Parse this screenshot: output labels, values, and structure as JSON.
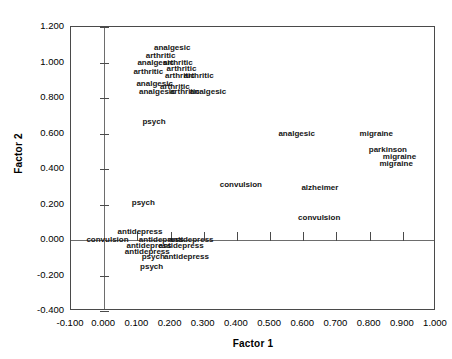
{
  "chart_data": {
    "type": "scatter",
    "title": "",
    "xlabel": "Factor 1",
    "ylabel": "Factor 2",
    "xlim": [
      -0.1,
      1.0
    ],
    "ylim": [
      -0.4,
      1.2
    ],
    "grid": false,
    "legend": "none",
    "xticks": [
      "-0.100",
      "0.000",
      "0.100",
      "0.200",
      "0.300",
      "0.400",
      "0.500",
      "0.600",
      "0.700",
      "0.800",
      "0.900",
      "1.000"
    ],
    "xtickvalues": [
      -0.1,
      0.0,
      0.1,
      0.2,
      0.3,
      0.4,
      0.5,
      0.6,
      0.7,
      0.8,
      0.9,
      1.0
    ],
    "yticks": [
      "1.200",
      "1.000",
      "0.800",
      "0.600",
      "0.400",
      "0.200",
      "0.000",
      "-0.200",
      "-0.400"
    ],
    "ytickvalues": [
      1.2,
      1.0,
      0.8,
      0.6,
      0.4,
      0.2,
      0.0,
      -0.2,
      -0.4
    ],
    "marker": "text-label",
    "points": [
      {
        "label": "analgesic",
        "x": 0.205,
        "y": 1.088
      },
      {
        "label": "arthritic",
        "x": 0.17,
        "y": 1.045
      },
      {
        "label": "analgesic",
        "x": 0.155,
        "y": 1.005
      },
      {
        "label": "arthritic",
        "x": 0.222,
        "y": 1.005
      },
      {
        "label": "arthritic",
        "x": 0.233,
        "y": 0.968
      },
      {
        "label": "arthritic",
        "x": 0.133,
        "y": 0.95
      },
      {
        "label": "arthritic",
        "x": 0.228,
        "y": 0.93
      },
      {
        "label": "arthritic",
        "x": 0.285,
        "y": 0.93
      },
      {
        "label": "analgesic",
        "x": 0.152,
        "y": 0.887
      },
      {
        "label": "arthritic",
        "x": 0.213,
        "y": 0.87
      },
      {
        "label": "analgesic",
        "x": 0.16,
        "y": 0.838
      },
      {
        "label": "arthritic",
        "x": 0.243,
        "y": 0.838
      },
      {
        "label": "analgesic",
        "x": 0.313,
        "y": 0.838
      },
      {
        "label": "psych",
        "x": 0.15,
        "y": 0.672
      },
      {
        "label": "analgesic",
        "x": 0.58,
        "y": 0.603
      },
      {
        "label": "migraine",
        "x": 0.82,
        "y": 0.603
      },
      {
        "label": "parkinson",
        "x": 0.855,
        "y": 0.512
      },
      {
        "label": "migraine",
        "x": 0.89,
        "y": 0.475
      },
      {
        "label": "migraine",
        "x": 0.88,
        "y": 0.435
      },
      {
        "label": "convulsion",
        "x": 0.412,
        "y": 0.318
      },
      {
        "label": "alzheimer",
        "x": 0.65,
        "y": 0.3
      },
      {
        "label": "psych",
        "x": 0.118,
        "y": 0.212
      },
      {
        "label": "convulsion",
        "x": 0.648,
        "y": 0.128
      },
      {
        "label": "antidepress",
        "x": 0.108,
        "y": 0.05
      },
      {
        "label": "convulsion",
        "x": 0.01,
        "y": 0.003
      },
      {
        "label": "antidepress",
        "x": 0.172,
        "y": 0.003
      },
      {
        "label": "antidepress",
        "x": 0.262,
        "y": 0.003
      },
      {
        "label": "antidepress",
        "x": 0.135,
        "y": -0.03
      },
      {
        "label": "antidepress",
        "x": 0.232,
        "y": -0.03
      },
      {
        "label": "antidepress",
        "x": 0.13,
        "y": -0.062
      },
      {
        "label": "psych",
        "x": 0.148,
        "y": -0.092
      },
      {
        "label": "antidepress",
        "x": 0.248,
        "y": -0.092
      },
      {
        "label": "psych",
        "x": 0.143,
        "y": -0.148
      }
    ]
  },
  "axes": {
    "x_title": "Factor 1",
    "y_title": "Factor 2"
  }
}
